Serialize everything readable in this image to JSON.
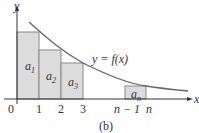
{
  "figure": {
    "caption": "(b)",
    "curve_label": "y = f(x)",
    "axis_labels": {
      "y": "y",
      "x": "x"
    },
    "tick_labels": [
      "0",
      "1",
      "2",
      "3",
      "n − 1",
      "n"
    ],
    "rectangles": [
      {
        "label": "a",
        "sub": "1"
      },
      {
        "label": "a",
        "sub": "2"
      },
      {
        "label": "a",
        "sub": "3"
      },
      {
        "label": "a",
        "sub": "n"
      }
    ],
    "colors": {
      "rect_fill": "#dcdcdc",
      "rect_stroke": "#888888",
      "curve": "#666666",
      "axis": "#333333"
    }
  }
}
